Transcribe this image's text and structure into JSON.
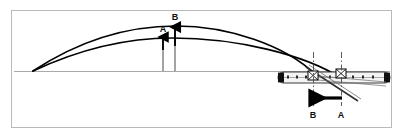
{
  "figure": {
    "background_color": "#ffffff",
    "frame": {
      "name": "diagram-border",
      "color": "#b9b9b9",
      "x": 11,
      "y": 10,
      "width": 381,
      "height": 118
    },
    "baseline": {
      "name": "horizontal-reference-line",
      "color": "#a9a9a9",
      "y": 71,
      "x_start": 14,
      "x_end": 390
    },
    "curves": [
      {
        "id": "curve-B",
        "label": "B",
        "description": "upper higher-arc trajectory",
        "color": "#000000",
        "stroke_width": 1.6,
        "start": [
          33,
          71
        ],
        "apex": [
          176,
          26
        ],
        "end": [
          316,
          75
        ]
      },
      {
        "id": "curve-A",
        "label": "A",
        "description": "lower flatter-arc trajectory",
        "color": "#000000",
        "stroke_width": 1.6,
        "start": [
          33,
          71
        ],
        "apex": [
          170,
          38
        ],
        "end": [
          341,
          77
        ]
      }
    ],
    "height_arrows": [
      {
        "id": "arrow-A",
        "label": "A",
        "description": "height of lower trajectory A",
        "x": 163,
        "tail_y": 71,
        "head_y": 36,
        "label_x": 163,
        "label_y": 31,
        "color": "#000000"
      },
      {
        "id": "arrow-B",
        "label": "B",
        "description": "height of upper trajectory B",
        "x": 175,
        "tail_y": 71,
        "head_y": 26,
        "label_x": 175,
        "label_y": 19,
        "color": "#000000"
      }
    ],
    "center_lines": [
      {
        "id": "centerline-B",
        "label": "B",
        "x": 313,
        "y_top": 52,
        "y_bottom": 106,
        "label_x": 313,
        "label_y": 115,
        "color": "#444444",
        "style": "dash-dot"
      },
      {
        "id": "centerline-A",
        "label": "A",
        "x": 341,
        "y_top": 52,
        "y_bottom": 106,
        "label_x": 341,
        "label_y": 115,
        "color": "#444444",
        "style": "dash-dot"
      }
    ],
    "motion_arrow": {
      "id": "adjustment-direction-arrow",
      "description": "solid arrow pointing left, direction of adjustment from A to B",
      "direction": "left",
      "tail_x": 341,
      "head_x": 315,
      "y": 98,
      "color": "#000000"
    },
    "mechanism": {
      "name": "slotted-bar-linkage",
      "description": "horizontal slotted bar with rounded dark ends, two pivot blocks and an inclined lever arm",
      "bar": {
        "x": 278,
        "y": 72,
        "width": 112,
        "height": 11,
        "fill": "#f2f2f2",
        "stroke": "#3a3a3a",
        "end_cap_color": "#111111"
      },
      "bar_holes": [
        287,
        296,
        305,
        329,
        352,
        362,
        372
      ],
      "pivots": [
        {
          "id": "pivot-B",
          "x": 313,
          "y": 77
        },
        {
          "id": "pivot-A",
          "x": 341,
          "y": 77
        }
      ],
      "lever": {
        "id": "lever-arm",
        "from": [
          308,
          68
        ],
        "to": [
          356,
          100
        ],
        "color": "#333333"
      }
    }
  }
}
